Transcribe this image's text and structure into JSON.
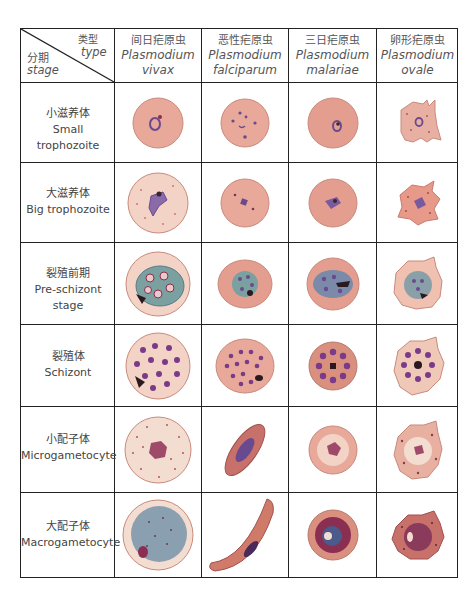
{
  "corner": {
    "type_cn": "类型",
    "type_en": "type",
    "stage_cn": "分期",
    "stage_en": "stage"
  },
  "columns": [
    {
      "cn": "间日疟原虫",
      "latin1": "Plasmodium",
      "latin2": "vivax"
    },
    {
      "cn": "恶性疟原虫",
      "latin1": "Plasmodium",
      "latin2": "falciparum"
    },
    {
      "cn": "三日疟原虫",
      "latin1": "Plasmodium",
      "latin2": "malariae"
    },
    {
      "cn": "卵形疟原虫",
      "latin1": "Plasmodium",
      "latin2": "ovale"
    }
  ],
  "rows": [
    {
      "cn": "小滋养体",
      "en": "Small trophozoite"
    },
    {
      "cn": "大滋养体",
      "en": "Big trophozoite"
    },
    {
      "cn": "裂殖前期",
      "en": "Pre-schizont stage"
    },
    {
      "cn": "裂殖体",
      "en": "Schizont"
    },
    {
      "cn": "小配子体",
      "en": "Microgametocyte"
    },
    {
      "cn": "大配子体",
      "en": "Macrogametocyte"
    }
  ],
  "colors": {
    "rbc": "#e8a89a",
    "rbc_light": "#f3d3c6",
    "rbc_dark": "#d98a7c",
    "parasite": "#6a4a8e",
    "pigment": "#3a2430",
    "nucleus": "#8a2f52",
    "grid": "#222222"
  }
}
